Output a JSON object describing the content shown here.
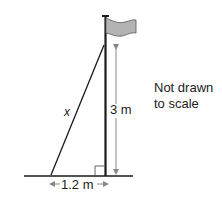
{
  "diagram": {
    "type": "right-triangle-flagpole",
    "labels": {
      "hypotenuse": "x",
      "height": "3 m",
      "base": "1.2 m",
      "note_line1": "Not drawn",
      "note_line2": "to scale"
    },
    "values": {
      "height_m": 3,
      "base_m": 1.2,
      "hypotenuse": "x"
    },
    "colors": {
      "line": "#1a1a1a",
      "flag_fill": "#b3b3b3",
      "arrow": "#888888"
    }
  }
}
